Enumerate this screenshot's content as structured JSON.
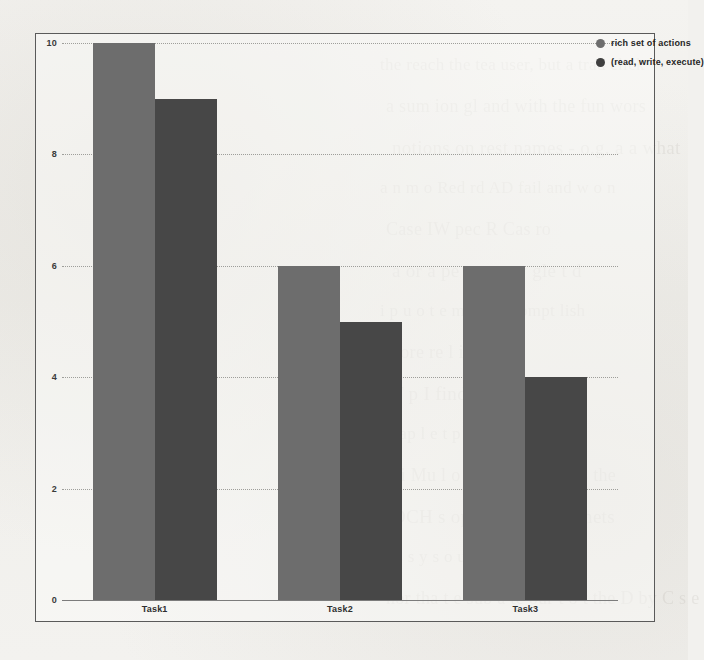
{
  "chart_data": {
    "type": "bar",
    "title": "",
    "xlabel": "",
    "ylabel": "Proportion of Correct Completion",
    "categories": [
      "Task1",
      "Task2",
      "Task3"
    ],
    "series": [
      {
        "name": "rich set of actions",
        "color": "#6d6d6d",
        "values": [
          10,
          6,
          6
        ]
      },
      {
        "name": "(read, write, execute)",
        "color": "#3f3f3f",
        "values": [
          9,
          5,
          4
        ]
      }
    ],
    "ylim": [
      0,
      10
    ],
    "yticks": [
      0,
      2,
      4,
      6,
      8,
      10
    ],
    "ytick_labels": [
      "0",
      "2",
      "4",
      "6",
      "8",
      "10"
    ],
    "grid": true,
    "grid_style": "dotted",
    "legend_position": "top-right"
  },
  "legend": {
    "items": [
      {
        "label": "rich set of actions"
      },
      {
        "label": "(read, write, execute)"
      }
    ]
  },
  "background_bleed": [
    "the reach the tea user, but a trad click",
    "a sum ion gl and with the fun wors",
    "notions on rest names - o.g. a    a what",
    "a n m o Red rd AD fail and w    o n",
    "Case IW  pec R   Cas         ro",
    "a    or   a pe m e c.       y gle t    d",
    "i  p u  o t e   ma   a  ve  compt lish",
    "more re l i   s t    e",
    "T p I find e   s   e d v  e  p e",
    "e sap l e t    p    th l  c    y  p tions",
    "thi Mu l o M  ws o   t n  s. o  s  the",
    "OCH  s ope      e  mo  n   t  o  n  nets",
    "A  s  s y    s   o u  i  r  e d  m e",
    "nor  tha t e sub a  te   our t  o   t   the  D  by  C  s e"
  ]
}
